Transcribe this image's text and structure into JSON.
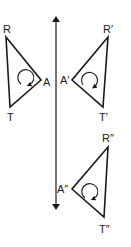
{
  "diagram": {
    "title": "",
    "mirror_line": {
      "name": "line-of-reflection",
      "x": 56,
      "y_top": 15,
      "y_bottom": 211,
      "arrows": "both"
    },
    "triangles": [
      {
        "name": "original",
        "vertices": {
          "R": [
            6,
            37
          ],
          "A": [
            41,
            80
          ],
          "T": [
            10,
            107
          ]
        },
        "labels": {
          "R": "R",
          "A": "A",
          "T": "T"
        },
        "orientation_arrow": "clockwise"
      },
      {
        "name": "reflection",
        "vertices": {
          "R": [
            108,
            37
          ],
          "A": [
            72,
            80
          ],
          "T": [
            103,
            107
          ]
        },
        "labels": {
          "R": "R′",
          "A": "A′",
          "T": "T′"
        },
        "orientation_arrow": "counterclockwise"
      },
      {
        "name": "image",
        "vertices": {
          "R": [
            108,
            147
          ],
          "A": [
            72,
            189
          ],
          "T": [
            104,
            217
          ]
        },
        "labels": {
          "R": "R″",
          "A": "A″",
          "T": "T″"
        },
        "orientation_arrow": "counterclockwise"
      }
    ]
  }
}
